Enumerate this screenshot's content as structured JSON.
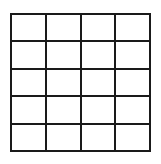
{
  "grid": {
    "rows": 5,
    "columns": 4,
    "line_color": "#1a1a1a",
    "background_color": "#ffffff",
    "cells": [
      [
        "",
        "",
        "",
        ""
      ],
      [
        "",
        "",
        "",
        ""
      ],
      [
        "",
        "",
        "",
        ""
      ],
      [
        "",
        "",
        "",
        ""
      ],
      [
        "",
        "",
        "",
        ""
      ]
    ]
  }
}
